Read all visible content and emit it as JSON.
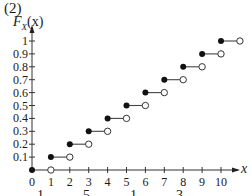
{
  "figure_label": "(2)",
  "chart_data": {
    "type": "step",
    "title": "",
    "ylabel": "F_X(x)",
    "ylabel_display": {
      "F": "F",
      "sub": "X",
      "arg": "(x)"
    },
    "xlabel": "x",
    "x_ticks": [
      "0",
      "1",
      "2",
      "3",
      "4",
      "5",
      "6",
      "7",
      "8",
      "9",
      "10"
    ],
    "y_ticks": [
      "0.1",
      "0.2",
      "0.3",
      "0.4",
      "0.5",
      "0.6",
      "0.7",
      "0.8",
      "0.9",
      "1"
    ],
    "xlim": [
      0,
      10.6
    ],
    "ylim": [
      0,
      1.1
    ],
    "grid": false,
    "segments": [
      {
        "x_start": 0,
        "x_end": 1,
        "y": 0.0
      },
      {
        "x_start": 1,
        "x_end": 2,
        "y": 0.1
      },
      {
        "x_start": 2,
        "x_end": 3,
        "y": 0.2
      },
      {
        "x_start": 3,
        "x_end": 4,
        "y": 0.3
      },
      {
        "x_start": 4,
        "x_end": 5,
        "y": 0.4
      },
      {
        "x_start": 5,
        "x_end": 6,
        "y": 0.5
      },
      {
        "x_start": 6,
        "x_end": 7,
        "y": 0.6
      },
      {
        "x_start": 7,
        "x_end": 8,
        "y": 0.7
      },
      {
        "x_start": 8,
        "x_end": 9,
        "y": 0.8
      },
      {
        "x_start": 9,
        "x_end": 10,
        "y": 0.9
      },
      {
        "x_start": 10,
        "x_end": 11,
        "y": 1.0
      }
    ],
    "markers": {
      "start": "filled-circle",
      "end": "open-circle"
    }
  },
  "cropped_bottom_text": [
    "1",
    "5",
    "1",
    "3"
  ]
}
